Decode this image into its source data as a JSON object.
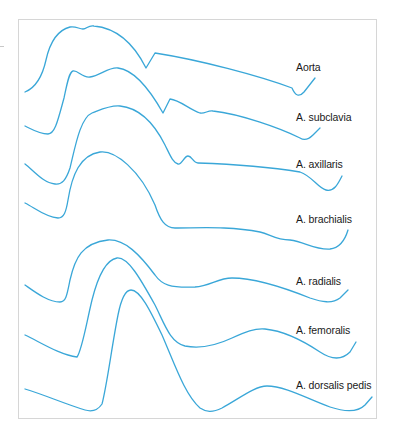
{
  "figure": {
    "line_color": "#3aa7d8",
    "frame_color": "#d6d6d6",
    "labels": [
      {
        "text": "Aorta",
        "x": 296,
        "y": 61
      },
      {
        "text": "A. subclavia",
        "x": 296,
        "y": 111
      },
      {
        "text": "A. axillaris",
        "x": 296,
        "y": 158
      },
      {
        "text": "A. brachialis",
        "x": 296,
        "y": 213
      },
      {
        "text": "A. radialis",
        "x": 296,
        "y": 275
      },
      {
        "text": "A. femoralis",
        "x": 296,
        "y": 324
      },
      {
        "text": "A. dorsalis pedis",
        "x": 296,
        "y": 379
      }
    ]
  },
  "chart_data": {
    "type": "line",
    "xlabel": "",
    "ylabel": "",
    "grid": false,
    "legend_position": "inline-right",
    "series": [
      {
        "name": "Aorta",
        "path": "M25,92 C35,88 42,78 46,60 C50,42 58,30 70,27 C76,26 79,29 83,29 C87,29 88,25 94,26 C115,28 132,40 146,68 L155,53 C200,60 260,76 292,88 Q297,100 304,92 L315,78"
      },
      {
        "name": "A. subclavia",
        "path": "M25,126 C33,130 40,134 48,134 C55,134 58,120 64,98 C67,84 69,72 73,71 C78,70 82,78 90,77 C100,76 108,67 118,68 C135,70 150,90 163,113 L170,99 C180,100 190,110 200,113 C205,114 208,110 213,111 C240,114 280,128 300,138 Q306,142 313,135 L320,128"
      },
      {
        "name": "A. axillaris",
        "path": "M25,164 C33,170 43,183 55,184 C62,185 66,180 70,168 C75,148 80,118 92,113 C100,110 110,105 120,106 C140,108 155,125 165,145 C170,155 173,163 178,164 C182,165 184,156 188,156 C192,156 193,163 198,163 C230,164 270,167 300,172 C312,176 318,188 326,190 C334,192 338,184 342,176"
      },
      {
        "name": "A. brachialis",
        "path": "M25,203 C35,208 45,217 58,218 C64,218 66,212 68,200 C72,175 80,155 100,152 C115,150 140,170 155,205 C160,220 165,228 175,228 C200,228 230,226 260,232 C270,234 275,240 290,240 C305,242 315,250 330,249 C340,248 345,240 348,230"
      },
      {
        "name": "A. radialis",
        "path": "M25,285 C35,292 48,302 60,302 C66,302 67,295 70,280 C75,258 82,243 108,240 C125,239 140,255 155,275 C162,285 170,288 195,287 C210,286 218,278 232,278 C255,278 290,290 310,298 C322,302 332,304 340,298 L348,290"
      },
      {
        "name": "A. femoralis",
        "path": "M25,335 C40,342 60,355 77,357 C82,350 86,325 92,300 C97,280 105,260 117,258 C128,257 140,278 155,305 C165,325 170,342 185,346 C200,349 215,346 232,338 C245,332 255,328 265,329 C285,331 305,342 320,352 C332,360 342,360 350,352 L356,342"
      },
      {
        "name": "A. dorsalis pedis",
        "path": "M25,389 C45,395 65,404 85,410 C92,412 98,410 102,404 C107,385 112,345 118,315 C121,300 125,290 131,290 C140,290 150,310 162,335 C175,365 185,395 200,408 C206,412 212,413 222,408 C240,398 255,386 267,386 C285,386 310,400 330,407 C345,412 358,412 365,405 L372,397"
      }
    ],
    "annotations": [
      "Aorta",
      "A. subclavia",
      "A. axillaris",
      "A. brachialis",
      "A. radialis",
      "A. femoralis",
      "A. dorsalis pedis"
    ]
  }
}
